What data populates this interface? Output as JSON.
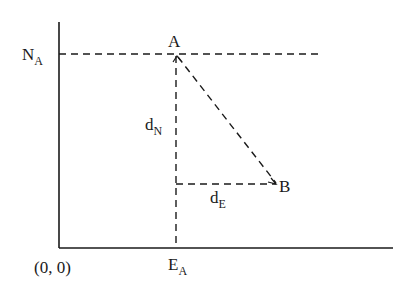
{
  "diagram": {
    "type": "coordinate-geometry",
    "colors": {
      "line": "#1a1a1a",
      "background": "#ffffff"
    },
    "origin_label": "(0, 0)",
    "y_axis_label": {
      "main": "N",
      "sub": "A"
    },
    "x_axis_label": {
      "main": "E",
      "sub": "A"
    },
    "points": [
      {
        "name": "A",
        "label": "A"
      },
      {
        "name": "B",
        "label": "B"
      }
    ],
    "segments": {
      "d_north": {
        "main": "d",
        "sub": "N"
      },
      "d_east": {
        "main": "d",
        "sub": "E"
      }
    }
  }
}
